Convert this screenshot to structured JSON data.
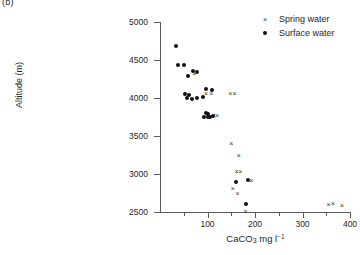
{
  "panel": {
    "label": "(b)"
  },
  "chart_data": {
    "type": "scatter",
    "title": "",
    "xlabel_text": "CaCO",
    "xlabel_sub": "3",
    "xlabel_rest": " mg l",
    "xlabel_sup": "−1",
    "xlabel_full": "CaCO3 mg l-1",
    "ylabel": "Altitude (m)",
    "xlim": [
      0,
      400
    ],
    "ylim": [
      2500,
      5000
    ],
    "xticks": [
      100,
      200,
      300,
      400
    ],
    "xticks_minor": [
      50,
      150,
      250,
      350
    ],
    "xtick_labels": [
      "100",
      "200",
      "300",
      "400"
    ],
    "yticks": [
      2500,
      3000,
      3500,
      4000,
      4500,
      5000
    ],
    "ytick_labels": [
      "2500",
      "3000",
      "3500",
      "4000",
      "4500",
      "5000"
    ],
    "grid": false,
    "legend_position": "top-right",
    "series": [
      {
        "name": "Spring water",
        "marker": "cross",
        "glyph": "×",
        "color": "#333333",
        "points": [
          {
            "x": 72,
            "y": 4320
          },
          {
            "x": 97,
            "y": 4055
          },
          {
            "x": 108,
            "y": 4055
          },
          {
            "x": 148,
            "y": 4060
          },
          {
            "x": 157,
            "y": 4060
          },
          {
            "x": 113,
            "y": 3765
          },
          {
            "x": 120,
            "y": 3765
          },
          {
            "x": 150,
            "y": 3395
          },
          {
            "x": 166,
            "y": 3240
          },
          {
            "x": 161,
            "y": 3030
          },
          {
            "x": 169,
            "y": 3030
          },
          {
            "x": 192,
            "y": 2920
          },
          {
            "x": 153,
            "y": 2805
          },
          {
            "x": 163,
            "y": 2745
          },
          {
            "x": 180,
            "y": 2510
          },
          {
            "x": 355,
            "y": 2595
          },
          {
            "x": 364,
            "y": 2610
          },
          {
            "x": 383,
            "y": 2590
          }
        ]
      },
      {
        "name": "Surface water",
        "marker": "dot",
        "glyph": "●",
        "color": "#111111",
        "points": [
          {
            "x": 33,
            "y": 4680
          },
          {
            "x": 38,
            "y": 4440
          },
          {
            "x": 50,
            "y": 4430
          },
          {
            "x": 59,
            "y": 4285
          },
          {
            "x": 70,
            "y": 4360
          },
          {
            "x": 77,
            "y": 4340
          },
          {
            "x": 52,
            "y": 4050
          },
          {
            "x": 60,
            "y": 4040
          },
          {
            "x": 57,
            "y": 3995
          },
          {
            "x": 68,
            "y": 3990
          },
          {
            "x": 78,
            "y": 3995
          },
          {
            "x": 90,
            "y": 4010
          },
          {
            "x": 97,
            "y": 4115
          },
          {
            "x": 110,
            "y": 4110
          },
          {
            "x": 97,
            "y": 3800
          },
          {
            "x": 101,
            "y": 3790
          },
          {
            "x": 93,
            "y": 3750
          },
          {
            "x": 100,
            "y": 3750
          },
          {
            "x": 106,
            "y": 3750
          },
          {
            "x": 112,
            "y": 3765
          },
          {
            "x": 159,
            "y": 2890
          },
          {
            "x": 186,
            "y": 2920
          },
          {
            "x": 180,
            "y": 2600
          }
        ]
      }
    ]
  },
  "legend": {
    "items": [
      {
        "label": "Spring water"
      },
      {
        "label": "Surface water"
      }
    ]
  }
}
